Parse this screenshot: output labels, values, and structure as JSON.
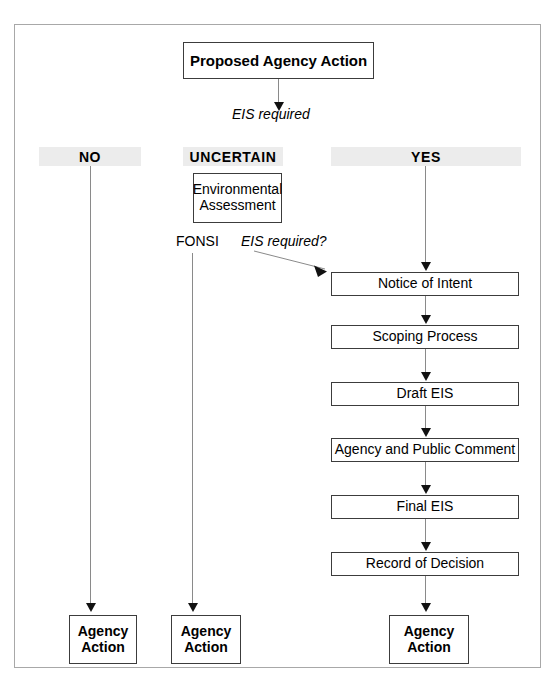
{
  "diagram": {
    "title_box": {
      "label": "Proposed Agency Action"
    },
    "edge_labels": {
      "from_proposal": "EIS required",
      "from_ea": "EIS required?",
      "fonsi": "FONSI"
    },
    "columns": [
      {
        "key": "no",
        "header": "NO"
      },
      {
        "key": "uncertain",
        "header": "UNCERTAIN"
      },
      {
        "key": "yes",
        "header": "YES"
      }
    ],
    "uncertain_box": {
      "label": "Environmental\nAssessment",
      "line1": "Environmental",
      "line2": "Assessment"
    },
    "process_steps": [
      {
        "label": "Notice of Intent"
      },
      {
        "label": "Scoping Process"
      },
      {
        "label": "Draft EIS"
      },
      {
        "label": "Agency and Public Comment"
      },
      {
        "label": "Final EIS"
      },
      {
        "label": "Record of Decision"
      }
    ],
    "outcomes": [
      {
        "line1": "Agency",
        "line2": "Action"
      },
      {
        "line1": "Agency",
        "line2": "Action"
      },
      {
        "line1": "Agency",
        "line2": "Action"
      }
    ],
    "colors": {
      "header_band": "#ececec",
      "box_border": "#3c3c3c",
      "frame_border": "#a8a8a8",
      "connector": "#8a8a8a",
      "arrowhead": "#111111",
      "text": "#000000"
    }
  }
}
